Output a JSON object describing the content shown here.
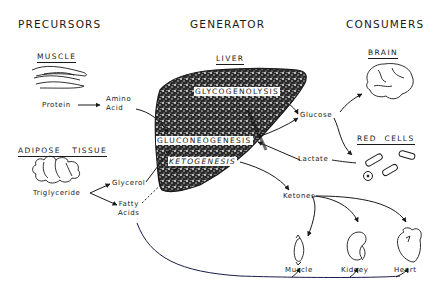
{
  "headers": {
    "precursors": "PRECURSORS",
    "generator": "GENERATOR",
    "consumers": "CONSUMERS"
  },
  "precursors": {
    "muscle": {
      "title": "MUSCLE",
      "icon": "muscle-fiber-icon"
    },
    "protein": "Protein",
    "amino_acid": [
      "Amino",
      "Acid"
    ],
    "adipose": {
      "title": "ADIPOSE   TISSUE",
      "icon": "fat-cells-icon"
    },
    "triglyceride": "Triglyceride",
    "glycerol": "Glycerol",
    "fatty_acids": [
      "Fatty",
      "Acids"
    ]
  },
  "generator": {
    "liver": {
      "title": "LIVER",
      "icon": "liver-icon"
    },
    "processes": {
      "glycogenolysis": "GLYCOGENOLYSIS",
      "gluconeogenesis": "GLUCONEOGENESIS",
      "ketogenesis": "KETOGENESIS"
    }
  },
  "consumers": {
    "brain": {
      "title": "BRAIN",
      "icon": "brain-icon"
    },
    "red_cells": {
      "title": "RED  CELLS",
      "icon": "red-blood-cells-icon"
    },
    "glucose": "Glucose",
    "lactate": "Lactate",
    "ketones": "Ketones",
    "organs": [
      {
        "label": "Muscle",
        "icon": "muscle-icon"
      },
      {
        "label": "Kidney",
        "icon": "kidney-icon"
      },
      {
        "label": "Heart",
        "icon": "heart-icon"
      }
    ]
  },
  "colors": {
    "ink": "#1a1a1a",
    "background": "#ffffff",
    "fatty_acid_line": "#1a1a4a"
  }
}
